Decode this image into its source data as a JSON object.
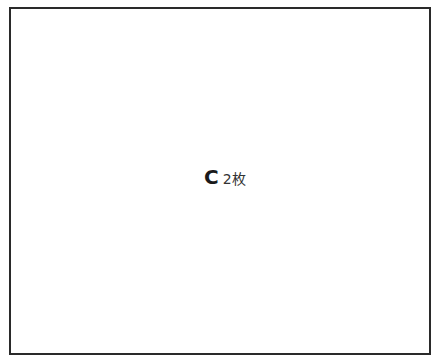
{
  "diagram": {
    "frame": {
      "border_color": "#2a2a2a"
    },
    "label": {
      "letter": "C",
      "count": "2枚"
    }
  }
}
